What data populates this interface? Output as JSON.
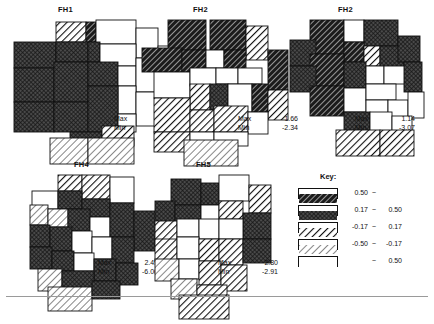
{
  "figure": {
    "width": 434,
    "height": 309,
    "background": "#ffffff",
    "line_color": "#111111"
  },
  "panels": [
    {
      "id": "fh1",
      "title": "FH1",
      "title_x": 58,
      "title_y": 5,
      "origin_x": 12,
      "origin_y": 20,
      "stats_x": 114,
      "stats_y": 114,
      "max_label": "Max",
      "max_value": "1.40",
      "min_label": "Min",
      "min_value": "-1.55"
    },
    {
      "id": "fh2a",
      "title": "FH2",
      "title_x": 193,
      "title_y": 5,
      "origin_x": 140,
      "origin_y": 20,
      "stats_x": 238,
      "stats_y": 114,
      "max_label": "Max",
      "max_value": "1.66",
      "min_label": "Min",
      "min_value": "-2.34"
    },
    {
      "id": "fh2b",
      "title": "FH2",
      "title_x": 338,
      "title_y": 5,
      "origin_x": 280,
      "origin_y": 20,
      "stats_x": 355,
      "stats_y": 114,
      "max_label": "Max",
      "max_value": "1.14",
      "min_label": "Min",
      "min_value": "-3.07"
    },
    {
      "id": "fh4",
      "title": "FH4",
      "title_x": 74,
      "title_y": 160,
      "origin_x": 30,
      "origin_y": 175,
      "stats_x": 98,
      "stats_y": 258,
      "max_label": "Max",
      "max_value": "2.49",
      "min_label": "Min",
      "min_value": "-6.06"
    },
    {
      "id": "fh5",
      "title": "FH5",
      "title_x": 196,
      "title_y": 160,
      "origin_x": 155,
      "origin_y": 175,
      "stats_x": 218,
      "stats_y": 258,
      "max_label": "Max",
      "max_value": "2.80",
      "min_label": "Min",
      "min_value": "-2.91"
    }
  ],
  "legend": {
    "title": "Key:",
    "title_x": 320,
    "title_y": 172,
    "x": 298,
    "y": 188,
    "row_height": 17,
    "items": [
      {
        "pattern": "dark-hatch",
        "low": "0.50",
        "sep": "~",
        "high": ""
      },
      {
        "pattern": "dark-crosshatch",
        "low": "0.17",
        "sep": "~",
        "high": "0.50"
      },
      {
        "pattern": "light-thick-hatch",
        "low": "-0.17",
        "sep": "~",
        "high": "0.17"
      },
      {
        "pattern": "light-thin-hatch",
        "low": "-0.50",
        "sep": "~",
        "high": "-0.17"
      },
      {
        "pattern": "white",
        "low": "",
        "sep": "~",
        "high": "0.50"
      }
    ]
  },
  "chart_data": {
    "type": "heatmap",
    "title": "",
    "subtitle": "",
    "xlabel": "",
    "ylabel": "",
    "legend_position": "right",
    "grid": false,
    "class_breaks": [
      "0.50 ~",
      "0.17 ~ 0.50",
      "-0.17 ~ 0.17",
      "-0.50 ~ -0.17",
      "~ 0.50"
    ],
    "class_patterns": [
      "dark-hatch",
      "dark-crosshatch",
      "light-thick-hatch",
      "light-thin-hatch",
      "white"
    ],
    "series": [
      {
        "name": "FH1",
        "max": 1.4,
        "min": -1.55,
        "regions": [
          {
            "x": 44,
            "y": 2,
            "w": 30,
            "h": 20,
            "cls": 2
          },
          {
            "x": 74,
            "y": 2,
            "w": 10,
            "h": 20,
            "cls": 0
          },
          {
            "x": 84,
            "y": 0,
            "w": 40,
            "h": 24,
            "cls": 4
          },
          {
            "x": 124,
            "y": 8,
            "w": 22,
            "h": 30,
            "cls": 4
          },
          {
            "x": 2,
            "y": 22,
            "w": 42,
            "h": 26,
            "cls": 1
          },
          {
            "x": 44,
            "y": 22,
            "w": 32,
            "h": 20,
            "cls": 1
          },
          {
            "x": 76,
            "y": 22,
            "w": 12,
            "h": 20,
            "cls": 1
          },
          {
            "x": 88,
            "y": 24,
            "w": 36,
            "h": 22,
            "cls": 4
          },
          {
            "x": 146,
            "y": 26,
            "w": 26,
            "h": 38,
            "cls": 4
          },
          {
            "x": 2,
            "y": 48,
            "w": 40,
            "h": 34,
            "cls": 1
          },
          {
            "x": 42,
            "y": 42,
            "w": 34,
            "h": 40,
            "cls": 1
          },
          {
            "x": 76,
            "y": 42,
            "w": 30,
            "h": 24,
            "cls": 1
          },
          {
            "x": 106,
            "y": 46,
            "w": 18,
            "h": 20,
            "cls": 4
          },
          {
            "x": 124,
            "y": 38,
            "w": 22,
            "h": 34,
            "cls": 4
          },
          {
            "x": 106,
            "y": 66,
            "w": 18,
            "h": 28,
            "cls": 4
          },
          {
            "x": 124,
            "y": 72,
            "w": 22,
            "h": 34,
            "cls": 4
          },
          {
            "x": 146,
            "y": 64,
            "w": 26,
            "h": 40,
            "cls": 4
          },
          {
            "x": 2,
            "y": 82,
            "w": 40,
            "h": 30,
            "cls": 1
          },
          {
            "x": 42,
            "y": 82,
            "w": 34,
            "h": 30,
            "cls": 1
          },
          {
            "x": 76,
            "y": 66,
            "w": 30,
            "h": 46,
            "cls": 1
          },
          {
            "x": 106,
            "y": 94,
            "w": 18,
            "h": 18,
            "cls": 4
          },
          {
            "x": 58,
            "y": 112,
            "w": 32,
            "h": 14,
            "cls": 1
          },
          {
            "x": 90,
            "y": 106,
            "w": 32,
            "h": 20,
            "cls": 2
          },
          {
            "x": 38,
            "y": 118,
            "w": 38,
            "h": 26,
            "cls": 3
          },
          {
            "x": 76,
            "y": 118,
            "w": 46,
            "h": 26,
            "cls": 3
          }
        ]
      },
      {
        "name": "FH2",
        "max": 1.66,
        "min": -2.34,
        "regions": [
          {
            "x": 28,
            "y": 0,
            "w": 38,
            "h": 30,
            "cls": 0
          },
          {
            "x": 70,
            "y": 0,
            "w": 36,
            "h": 30,
            "cls": 0
          },
          {
            "x": 106,
            "y": 6,
            "w": 22,
            "h": 34,
            "cls": 2
          },
          {
            "x": 2,
            "y": 28,
            "w": 40,
            "h": 24,
            "cls": 0
          },
          {
            "x": 42,
            "y": 30,
            "w": 24,
            "h": 22,
            "cls": 0
          },
          {
            "x": 66,
            "y": 30,
            "w": 18,
            "h": 18,
            "cls": 4
          },
          {
            "x": 84,
            "y": 30,
            "w": 22,
            "h": 22,
            "cls": 0
          },
          {
            "x": 128,
            "y": 30,
            "w": 20,
            "h": 40,
            "cls": 0
          },
          {
            "x": 14,
            "y": 52,
            "w": 36,
            "h": 26,
            "cls": 4
          },
          {
            "x": 50,
            "y": 48,
            "w": 26,
            "h": 18,
            "cls": 4
          },
          {
            "x": 76,
            "y": 48,
            "w": 22,
            "h": 16,
            "cls": 4
          },
          {
            "x": 98,
            "y": 48,
            "w": 24,
            "h": 16,
            "cls": 4
          },
          {
            "x": 50,
            "y": 64,
            "w": 20,
            "h": 26,
            "cls": 2
          },
          {
            "x": 70,
            "y": 64,
            "w": 18,
            "h": 26,
            "cls": 1
          },
          {
            "x": 88,
            "y": 64,
            "w": 24,
            "h": 28,
            "cls": 4
          },
          {
            "x": 112,
            "y": 64,
            "w": 16,
            "h": 28,
            "cls": 0
          },
          {
            "x": 128,
            "y": 70,
            "w": 20,
            "h": 30,
            "cls": 2
          },
          {
            "x": 14,
            "y": 78,
            "w": 36,
            "h": 34,
            "cls": 2
          },
          {
            "x": 50,
            "y": 90,
            "w": 24,
            "h": 22,
            "cls": 2
          },
          {
            "x": 74,
            "y": 86,
            "w": 34,
            "h": 26,
            "cls": 2
          },
          {
            "x": 108,
            "y": 92,
            "w": 20,
            "h": 22,
            "cls": 4
          },
          {
            "x": 14,
            "y": 112,
            "w": 36,
            "h": 20,
            "cls": 2
          },
          {
            "x": 50,
            "y": 112,
            "w": 24,
            "h": 20,
            "cls": 4
          },
          {
            "x": 74,
            "y": 112,
            "w": 34,
            "h": 14,
            "cls": 4
          },
          {
            "x": 44,
            "y": 120,
            "w": 54,
            "h": 26,
            "cls": 3
          }
        ]
      },
      {
        "name": "FH2",
        "max": 1.14,
        "min": -3.07,
        "regions": [
          {
            "x": 30,
            "y": 0,
            "w": 34,
            "h": 34,
            "cls": 0
          },
          {
            "x": 64,
            "y": 0,
            "w": 20,
            "h": 22,
            "cls": 4
          },
          {
            "x": 84,
            "y": 0,
            "w": 34,
            "h": 26,
            "cls": 1
          },
          {
            "x": 10,
            "y": 20,
            "w": 26,
            "h": 26,
            "cls": 1
          },
          {
            "x": 64,
            "y": 22,
            "w": 20,
            "h": 20,
            "cls": 0
          },
          {
            "x": 84,
            "y": 26,
            "w": 16,
            "h": 20,
            "cls": 2
          },
          {
            "x": 100,
            "y": 26,
            "w": 24,
            "h": 22,
            "cls": 1
          },
          {
            "x": 118,
            "y": 16,
            "w": 22,
            "h": 26,
            "cls": 1
          },
          {
            "x": 30,
            "y": 34,
            "w": 34,
            "h": 32,
            "cls": 0
          },
          {
            "x": 64,
            "y": 42,
            "w": 22,
            "h": 26,
            "cls": 1
          },
          {
            "x": 86,
            "y": 46,
            "w": 18,
            "h": 18,
            "cls": 4
          },
          {
            "x": 104,
            "y": 46,
            "w": 24,
            "h": 18,
            "cls": 4
          },
          {
            "x": 124,
            "y": 42,
            "w": 18,
            "h": 30,
            "cls": 1
          },
          {
            "x": 10,
            "y": 46,
            "w": 26,
            "h": 26,
            "cls": 1
          },
          {
            "x": 30,
            "y": 66,
            "w": 34,
            "h": 30,
            "cls": 0
          },
          {
            "x": 64,
            "y": 68,
            "w": 22,
            "h": 24,
            "cls": 4
          },
          {
            "x": 86,
            "y": 64,
            "w": 30,
            "h": 16,
            "cls": 4
          },
          {
            "x": 86,
            "y": 80,
            "w": 22,
            "h": 16,
            "cls": 4
          },
          {
            "x": 108,
            "y": 80,
            "w": 20,
            "h": 18,
            "cls": 4
          },
          {
            "x": 128,
            "y": 72,
            "w": 16,
            "h": 26,
            "cls": 4
          },
          {
            "x": 64,
            "y": 92,
            "w": 26,
            "h": 22,
            "cls": 1
          },
          {
            "x": 90,
            "y": 92,
            "w": 22,
            "h": 22,
            "cls": 4
          },
          {
            "x": 112,
            "y": 96,
            "w": 20,
            "h": 20,
            "cls": 4
          },
          {
            "x": 56,
            "y": 110,
            "w": 44,
            "h": 26,
            "cls": 2
          },
          {
            "x": 100,
            "y": 110,
            "w": 34,
            "h": 26,
            "cls": 2
          }
        ]
      },
      {
        "name": "FH4",
        "max": 2.49,
        "min": -6.06,
        "regions": [
          {
            "x": 28,
            "y": 0,
            "w": 24,
            "h": 16,
            "cls": 2
          },
          {
            "x": 52,
            "y": 0,
            "w": 28,
            "h": 24,
            "cls": 2
          },
          {
            "x": 80,
            "y": 2,
            "w": 24,
            "h": 26,
            "cls": 4
          },
          {
            "x": 2,
            "y": 16,
            "w": 26,
            "h": 18,
            "cls": 4
          },
          {
            "x": 28,
            "y": 16,
            "w": 24,
            "h": 18,
            "cls": 1
          },
          {
            "x": 52,
            "y": 24,
            "w": 28,
            "h": 18,
            "cls": 1
          },
          {
            "x": 0,
            "y": 30,
            "w": 18,
            "h": 20,
            "cls": 3
          },
          {
            "x": 18,
            "y": 34,
            "w": 20,
            "h": 18,
            "cls": 3
          },
          {
            "x": 38,
            "y": 34,
            "w": 22,
            "h": 22,
            "cls": 1
          },
          {
            "x": 60,
            "y": 42,
            "w": 20,
            "h": 20,
            "cls": 4
          },
          {
            "x": 80,
            "y": 28,
            "w": 24,
            "h": 34,
            "cls": 1
          },
          {
            "x": 104,
            "y": 36,
            "w": 22,
            "h": 40,
            "cls": 1
          },
          {
            "x": 0,
            "y": 50,
            "w": 20,
            "h": 22,
            "cls": 1
          },
          {
            "x": 20,
            "y": 52,
            "w": 22,
            "h": 24,
            "cls": 1
          },
          {
            "x": 42,
            "y": 56,
            "w": 20,
            "h": 22,
            "cls": 4
          },
          {
            "x": 62,
            "y": 62,
            "w": 20,
            "h": 22,
            "cls": 4
          },
          {
            "x": 82,
            "y": 62,
            "w": 22,
            "h": 26,
            "cls": 1
          },
          {
            "x": 0,
            "y": 72,
            "w": 22,
            "h": 22,
            "cls": 1
          },
          {
            "x": 22,
            "y": 76,
            "w": 22,
            "h": 20,
            "cls": 1
          },
          {
            "x": 44,
            "y": 78,
            "w": 20,
            "h": 18,
            "cls": 4
          },
          {
            "x": 64,
            "y": 84,
            "w": 22,
            "h": 22,
            "cls": 1
          },
          {
            "x": 86,
            "y": 88,
            "w": 22,
            "h": 22,
            "cls": 1
          },
          {
            "x": 8,
            "y": 94,
            "w": 24,
            "h": 22,
            "cls": 3
          },
          {
            "x": 32,
            "y": 96,
            "w": 32,
            "h": 22,
            "cls": 1
          },
          {
            "x": 18,
            "y": 112,
            "w": 44,
            "h": 24,
            "cls": 3
          },
          {
            "x": 62,
            "y": 106,
            "w": 28,
            "h": 18,
            "cls": 1
          }
        ]
      },
      {
        "name": "FH5",
        "max": 2.8,
        "min": -2.91,
        "regions": [
          {
            "x": 16,
            "y": 4,
            "w": 30,
            "h": 26,
            "cls": 1
          },
          {
            "x": 46,
            "y": 8,
            "w": 18,
            "h": 22,
            "cls": 1
          },
          {
            "x": 64,
            "y": 0,
            "w": 30,
            "h": 26,
            "cls": 4
          },
          {
            "x": 94,
            "y": 10,
            "w": 22,
            "h": 28,
            "cls": 2
          },
          {
            "x": 0,
            "y": 26,
            "w": 20,
            "h": 24,
            "cls": 1
          },
          {
            "x": 20,
            "y": 30,
            "w": 26,
            "h": 20,
            "cls": 1
          },
          {
            "x": 46,
            "y": 30,
            "w": 18,
            "h": 16,
            "cls": 4
          },
          {
            "x": 64,
            "y": 26,
            "w": 24,
            "h": 18,
            "cls": 2
          },
          {
            "x": 88,
            "y": 38,
            "w": 28,
            "h": 26,
            "cls": 1
          },
          {
            "x": 0,
            "y": 46,
            "w": 22,
            "h": 24,
            "cls": 2
          },
          {
            "x": 22,
            "y": 44,
            "w": 22,
            "h": 18,
            "cls": 4
          },
          {
            "x": 44,
            "y": 44,
            "w": 20,
            "h": 20,
            "cls": 4
          },
          {
            "x": 64,
            "y": 44,
            "w": 24,
            "h": 20,
            "cls": 4
          },
          {
            "x": 0,
            "y": 64,
            "w": 22,
            "h": 22,
            "cls": 2
          },
          {
            "x": 22,
            "y": 62,
            "w": 22,
            "h": 22,
            "cls": 4
          },
          {
            "x": 44,
            "y": 64,
            "w": 20,
            "h": 22,
            "cls": 2
          },
          {
            "x": 64,
            "y": 64,
            "w": 24,
            "h": 26,
            "cls": 2
          },
          {
            "x": 88,
            "y": 64,
            "w": 28,
            "h": 24,
            "cls": 1
          },
          {
            "x": 0,
            "y": 84,
            "w": 24,
            "h": 22,
            "cls": 3
          },
          {
            "x": 24,
            "y": 84,
            "w": 20,
            "h": 20,
            "cls": 4
          },
          {
            "x": 44,
            "y": 86,
            "w": 22,
            "h": 24,
            "cls": 2
          },
          {
            "x": 66,
            "y": 90,
            "w": 26,
            "h": 26,
            "cls": 2
          },
          {
            "x": 16,
            "y": 104,
            "w": 26,
            "h": 20,
            "cls": 3
          },
          {
            "x": 42,
            "y": 110,
            "w": 30,
            "h": 22,
            "cls": 2
          },
          {
            "x": 24,
            "y": 120,
            "w": 50,
            "h": 24,
            "cls": 2
          }
        ]
      }
    ]
  }
}
